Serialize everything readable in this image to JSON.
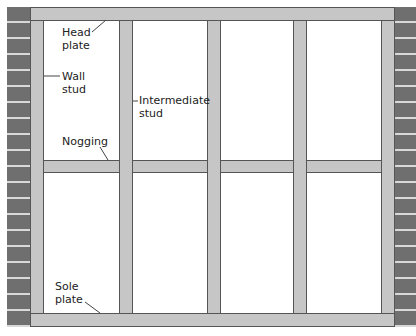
{
  "diagram": {
    "labels": {
      "head_plate": "Head\nplate",
      "wall_stud": "Wall\nstud",
      "intermediate_stud": "Intermediate\nstud",
      "nogging": "Nogging",
      "sole_plate": "Sole\nplate"
    },
    "colors": {
      "timber": "#c6c6c6",
      "timber_outline": "#555555",
      "brick": "#6f6f6f",
      "mortar": "#d8d8d8",
      "background": "#ffffff"
    }
  }
}
